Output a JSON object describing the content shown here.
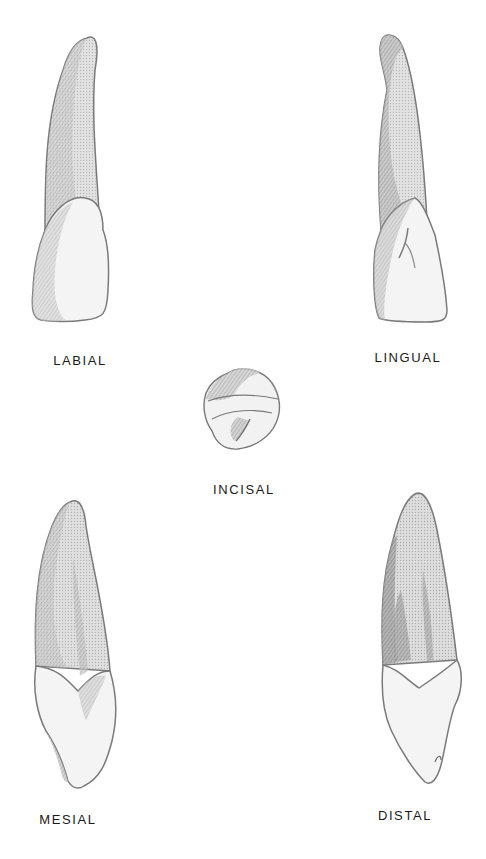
{
  "figure": {
    "views": [
      {
        "id": "labial",
        "label": "LABIAL"
      },
      {
        "id": "lingual",
        "label": "LINGUAL"
      },
      {
        "id": "incisal",
        "label": "INCISAL"
      },
      {
        "id": "mesial",
        "label": "MESIAL"
      },
      {
        "id": "distal",
        "label": "DISTAL"
      }
    ],
    "colors": {
      "background": "#ffffff",
      "outline": "#7a7a7a",
      "root_shade": "#d6d6d6",
      "dark_shade": "#9a9a9a",
      "crown_fill": "#f4f4f4",
      "label_text": "#1a1a1a"
    }
  }
}
